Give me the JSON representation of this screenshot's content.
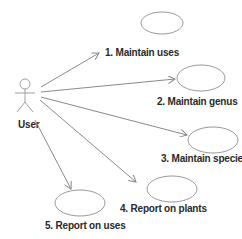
{
  "diagram": {
    "type": "use-case",
    "actor": {
      "label": "User"
    },
    "use_cases": [
      {
        "id": 1,
        "label": "1. Maintain uses"
      },
      {
        "id": 2,
        "label": "2. Maintain genus"
      },
      {
        "id": 3,
        "label": "3. Maintain species"
      },
      {
        "id": 4,
        "label": "4. Report on plants"
      },
      {
        "id": 5,
        "label": "5. Report on uses"
      }
    ],
    "associations": [
      {
        "from": "User",
        "to": 1
      },
      {
        "from": "User",
        "to": 2
      },
      {
        "from": "User",
        "to": 3
      },
      {
        "from": "User",
        "to": 4
      },
      {
        "from": "User",
        "to": 5
      }
    ],
    "colors": {
      "lines": "#8a8a8a",
      "text": "#2a2a2a",
      "background": "#ffffff"
    }
  }
}
